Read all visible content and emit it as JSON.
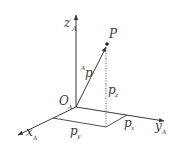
{
  "diagram": {
    "type": "3d-coordinate-frame",
    "colors": {
      "line": "#3a3a3a",
      "background": "#ffffff"
    },
    "origin": {
      "label": "O",
      "subscript": "A"
    },
    "axes": {
      "z": {
        "label": "z",
        "subscript": "A"
      },
      "x": {
        "label": "x",
        "subscript": "A"
      },
      "y": {
        "label": "y",
        "subscript": "A"
      }
    },
    "point": {
      "label": "P"
    },
    "vector": {
      "superscript": "A",
      "label": "p"
    },
    "components": {
      "pz": {
        "label": "p",
        "subscript": "z"
      },
      "px": {
        "label": "p",
        "subscript": "x"
      },
      "py": {
        "label": "p",
        "subscript": "y"
      }
    }
  }
}
